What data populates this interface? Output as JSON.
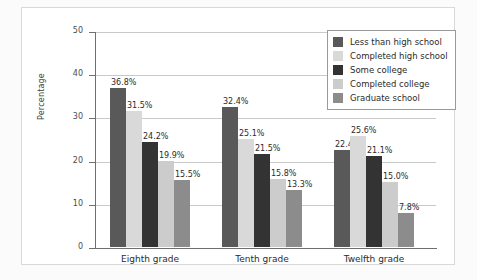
{
  "chart_data": {
    "type": "bar",
    "title": "",
    "xlabel": "",
    "ylabel": "Percentage",
    "ylim": [
      0,
      50
    ],
    "yticks": [
      "0",
      "10",
      "20",
      "30",
      "40",
      "50"
    ],
    "grid": true,
    "legend_position": "top-right",
    "categories": [
      "Eighth grade",
      "Tenth grade",
      "Twelfth grade"
    ],
    "series": [
      {
        "name": "Less than high school",
        "color": "#595959",
        "values": [
          36.8,
          32.4,
          22.4
        ],
        "labels": [
          "36.8%",
          "32.4%",
          "22.4%"
        ]
      },
      {
        "name": "Completed high school",
        "color": "#d9d9d9",
        "values": [
          31.5,
          25.1,
          25.6
        ],
        "labels": [
          "31.5%",
          "25.1%",
          "25.6%"
        ]
      },
      {
        "name": "Some college",
        "color": "#333333",
        "values": [
          24.2,
          21.5,
          21.1
        ],
        "labels": [
          "24.2%",
          "21.5%",
          "21.1%"
        ]
      },
      {
        "name": "Completed college",
        "color": "#cccccc",
        "values": [
          19.9,
          15.8,
          15.0
        ],
        "labels": [
          "19.9%",
          "15.8%",
          "15.0%"
        ]
      },
      {
        "name": "Graduate school",
        "color": "#8c8c8c",
        "values": [
          15.5,
          13.3,
          7.8
        ],
        "labels": [
          "15.5%",
          "13.3%",
          "7.8%"
        ]
      }
    ]
  }
}
